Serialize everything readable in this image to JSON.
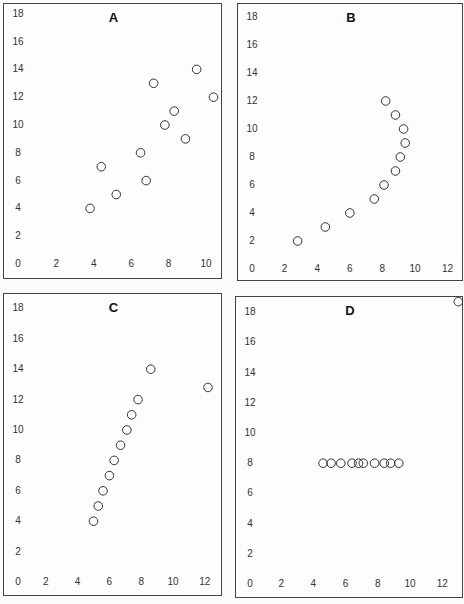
{
  "chart_data": [
    {
      "type": "scatter",
      "title": "A",
      "xlabel": "",
      "ylabel": "",
      "x_ticks": [
        0,
        2,
        4,
        6,
        8,
        10
      ],
      "y_ticks": [
        0,
        2,
        4,
        6,
        8,
        10,
        12,
        14,
        16,
        18
      ],
      "xlim": [
        0,
        10.8
      ],
      "ylim": [
        0,
        18
      ],
      "grid": false,
      "points": [
        {
          "x": 10,
          "y": 8.04
        },
        {
          "x": 8,
          "y": 6.95
        },
        {
          "x": 13,
          "y": 7.58
        },
        {
          "x": 9,
          "y": 8.81
        },
        {
          "x": 11,
          "y": 8.33
        },
        {
          "x": 14,
          "y": 9.96
        },
        {
          "x": 6,
          "y": 7.24
        },
        {
          "x": 4,
          "y": 4.26
        },
        {
          "x": 12,
          "y": 10.84
        },
        {
          "x": 7,
          "y": 4.82
        },
        {
          "x": 5,
          "y": 5.68
        }
      ],
      "points_as_plotted": [
        {
          "x": 3.8,
          "y": 4
        },
        {
          "x": 4.4,
          "y": 7
        },
        {
          "x": 5.2,
          "y": 5
        },
        {
          "x": 6.5,
          "y": 8
        },
        {
          "x": 6.8,
          "y": 6
        },
        {
          "x": 7.2,
          "y": 13
        },
        {
          "x": 7.8,
          "y": 10
        },
        {
          "x": 8.3,
          "y": 11
        },
        {
          "x": 8.9,
          "y": 9
        },
        {
          "x": 9.5,
          "y": 14
        },
        {
          "x": 10.4,
          "y": 12
        }
      ]
    },
    {
      "type": "scatter",
      "title": "B",
      "xlabel": "",
      "ylabel": "",
      "x_ticks": [
        0,
        2,
        4,
        6,
        8,
        10,
        12
      ],
      "y_ticks": [
        0,
        2,
        4,
        6,
        8,
        10,
        12,
        14,
        16,
        18
      ],
      "xlim": [
        0,
        13
      ],
      "ylim": [
        0,
        18
      ],
      "grid": false,
      "points_as_plotted": [
        {
          "x": 2.8,
          "y": 2
        },
        {
          "x": 4.5,
          "y": 3
        },
        {
          "x": 6,
          "y": 4
        },
        {
          "x": 7.5,
          "y": 5
        },
        {
          "x": 8.1,
          "y": 6
        },
        {
          "x": 8.8,
          "y": 7
        },
        {
          "x": 9.1,
          "y": 8
        },
        {
          "x": 9.4,
          "y": 9
        },
        {
          "x": 9.3,
          "y": 10
        },
        {
          "x": 8.8,
          "y": 11
        },
        {
          "x": 8.2,
          "y": 12
        }
      ]
    },
    {
      "type": "scatter",
      "title": "C",
      "xlabel": "",
      "ylabel": "",
      "x_ticks": [
        0,
        2,
        4,
        6,
        8,
        10,
        12
      ],
      "y_ticks": [
        0,
        2,
        4,
        6,
        8,
        10,
        12,
        14,
        16,
        18
      ],
      "xlim": [
        0,
        13
      ],
      "ylim": [
        0,
        18
      ],
      "grid": false,
      "points_as_plotted": [
        {
          "x": 5.0,
          "y": 4
        },
        {
          "x": 5.3,
          "y": 5
        },
        {
          "x": 5.6,
          "y": 6
        },
        {
          "x": 6.0,
          "y": 7
        },
        {
          "x": 6.3,
          "y": 8
        },
        {
          "x": 6.7,
          "y": 9
        },
        {
          "x": 7.1,
          "y": 10
        },
        {
          "x": 7.4,
          "y": 11
        },
        {
          "x": 7.8,
          "y": 12
        },
        {
          "x": 8.6,
          "y": 14
        },
        {
          "x": 12.2,
          "y": 12.8
        }
      ]
    },
    {
      "type": "scatter",
      "title": "D",
      "xlabel": "",
      "ylabel": "",
      "x_ticks": [
        0,
        2,
        4,
        6,
        8,
        10,
        12
      ],
      "y_ticks": [
        0,
        2,
        4,
        6,
        8,
        10,
        12,
        14,
        16,
        18
      ],
      "xlim": [
        0,
        13
      ],
      "ylim": [
        0,
        18
      ],
      "grid": false,
      "points_as_plotted": [
        {
          "x": 4.6,
          "y": 8
        },
        {
          "x": 5.1,
          "y": 8
        },
        {
          "x": 5.7,
          "y": 8
        },
        {
          "x": 6.4,
          "y": 8
        },
        {
          "x": 6.8,
          "y": 8
        },
        {
          "x": 7.1,
          "y": 8
        },
        {
          "x": 7.8,
          "y": 8
        },
        {
          "x": 8.4,
          "y": 8
        },
        {
          "x": 8.8,
          "y": 8
        },
        {
          "x": 9.3,
          "y": 8
        },
        {
          "x": 13.0,
          "y": 18.7
        }
      ]
    }
  ],
  "panels": [
    {
      "title": "A",
      "box": {
        "left": 3,
        "top": 3,
        "width": 219,
        "height": 276
      },
      "origin_px": {
        "x": 18,
        "y": 263
      },
      "px_per_unit": {
        "x": 18.7,
        "y": 13.9
      },
      "x_tick_labels": [
        "0",
        "2",
        "4",
        "6",
        "8",
        "10"
      ],
      "y_tick_labels": [
        "0",
        "2",
        "4",
        "6",
        "8",
        "10",
        "12",
        "14",
        "16",
        "18"
      ]
    },
    {
      "title": "B",
      "box": {
        "left": 237,
        "top": 3,
        "width": 226,
        "height": 278
      },
      "origin_px": {
        "x": 251,
        "y": 268
      },
      "px_per_unit": {
        "x": 16.3,
        "y": 14.0
      },
      "x_tick_labels": [
        "0",
        "2",
        "4",
        "6",
        "8",
        "10",
        "12"
      ],
      "y_tick_labels": [
        "0",
        "2",
        "4",
        "6",
        "8",
        "10",
        "12",
        "14",
        "16",
        "18"
      ]
    },
    {
      "title": "C",
      "box": {
        "left": 3,
        "top": 293,
        "width": 219,
        "height": 303
      },
      "origin_px": {
        "x": 13,
        "y": 581
      },
      "px_per_unit": {
        "x": 15.9,
        "y": 15.2
      },
      "x_tick_labels": [
        "0",
        "2",
        "4",
        "6",
        "8",
        "10",
        "12"
      ],
      "y_tick_labels": [
        "0",
        "2",
        "4",
        "6",
        "8",
        "10",
        "12",
        "14",
        "16",
        "18"
      ]
    },
    {
      "title": "D",
      "box": {
        "left": 235,
        "top": 296,
        "width": 228,
        "height": 302
      },
      "origin_px": {
        "x": 248,
        "y": 583
      },
      "px_per_unit": {
        "x": 16.1,
        "y": 15.1
      },
      "x_tick_labels": [
        "0",
        "2",
        "4",
        "6",
        "8",
        "10",
        "12"
      ],
      "y_tick_labels": [
        "0",
        "2",
        "4",
        "6",
        "8",
        "10",
        "12",
        "14",
        "16",
        "18"
      ]
    }
  ]
}
